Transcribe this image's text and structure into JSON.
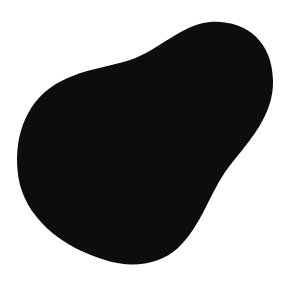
{
  "figure": {
    "shape_color": "#0d0d0d",
    "background_color": "#ffffff"
  }
}
